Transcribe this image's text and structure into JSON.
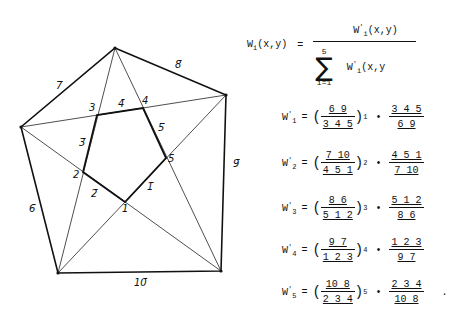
{
  "diagram": {
    "outer_vertices": [
      {
        "id": "top",
        "x": 115,
        "y": 48
      },
      {
        "id": "right",
        "x": 226,
        "y": 95
      },
      {
        "id": "bottom_right",
        "x": 221,
        "y": 271
      },
      {
        "id": "bottom_left",
        "x": 58,
        "y": 273
      },
      {
        "id": "left",
        "x": 21,
        "y": 127
      }
    ],
    "inner_points": [
      {
        "label": "1",
        "x": 125,
        "y": 202
      },
      {
        "label": "2",
        "x": 83,
        "y": 172
      },
      {
        "label": "3",
        "x": 97,
        "y": 115
      },
      {
        "label": "4",
        "x": 143,
        "y": 108
      },
      {
        "label": "5",
        "x": 166,
        "y": 158
      }
    ],
    "edge_labels": [
      {
        "label": "1̄",
        "x": 147,
        "y": 190
      },
      {
        "label": "2̄",
        "x": 91,
        "y": 197
      },
      {
        "label": "3̄",
        "x": 79,
        "y": 146
      },
      {
        "label": "4̄",
        "x": 118,
        "y": 107
      },
      {
        "label": "5̄",
        "x": 158,
        "y": 131
      },
      {
        "label": "6̄",
        "x": 29,
        "y": 212
      },
      {
        "label": "7̄",
        "x": 56,
        "y": 89
      },
      {
        "label": "8̄",
        "x": 175,
        "y": 68
      },
      {
        "label": "9̄",
        "x": 233,
        "y": 167
      },
      {
        "label": "10̄",
        "x": 134,
        "y": 286
      }
    ],
    "vertex_labels": [
      {
        "label": "1",
        "x": 122,
        "y": 212
      },
      {
        "label": "2",
        "x": 73,
        "y": 178
      },
      {
        "label": "3",
        "x": 89,
        "y": 111
      },
      {
        "label": "4",
        "x": 142,
        "y": 104
      },
      {
        "label": "5",
        "x": 168,
        "y": 162
      }
    ]
  },
  "formula": {
    "lhs": "W",
    "lhs_sub": "i",
    "lhs_args": "(x,y)",
    "equals": "=",
    "numerator": "W",
    "numerator_sup": "'",
    "numerator_sub": "i",
    "numerator_args": "(x,y)",
    "sum_upper": "5",
    "sum_lower": "i=1",
    "sum_symbol": "∑",
    "denominator_term": "W",
    "denominator_sup": "'",
    "denominator_sub": "i",
    "denominator_args": "(x,y"
  },
  "rows": [
    {
      "lhs": "W",
      "sub": "1",
      "sup": "'",
      "eq": "=",
      "num": "6 9",
      "den": "3 4 5",
      "idx": "1",
      "dot": "•",
      "rnum": "3 4 5",
      "rden": "6 9",
      "trail": ""
    },
    {
      "lhs": "W",
      "sub": "2",
      "sup": "'",
      "eq": "=",
      "num": "7 10",
      "den": "4 5 1",
      "idx": "2",
      "dot": "•",
      "rnum": "4 5 1",
      "rden": "7 10",
      "trail": ""
    },
    {
      "lhs": "W",
      "sub": "3",
      "sup": "'",
      "eq": "=",
      "num": "8 6",
      "den": "5 1 2",
      "idx": "3",
      "dot": "•",
      "rnum": "5 1 2",
      "rden": "8 6",
      "trail": ""
    },
    {
      "lhs": "W",
      "sub": "4",
      "sup": "'",
      "eq": "=",
      "num": "9 7",
      "den": "1 2 3",
      "idx": "4",
      "dot": "•",
      "rnum": "1 2 3",
      "rden": "9 7",
      "trail": ""
    },
    {
      "lhs": "W",
      "sub": "5",
      "sup": "'",
      "eq": "=",
      "num": "10 8",
      "den": "2 3 4",
      "idx": "5",
      "dot": "•",
      "rnum": "2 3 4",
      "rden": "10 8",
      "trail": "."
    }
  ]
}
